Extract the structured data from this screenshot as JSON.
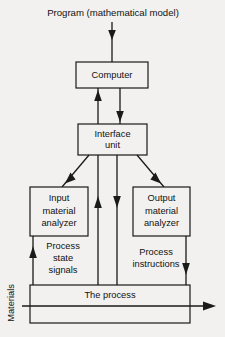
{
  "diagram": {
    "title": "Program (mathematical model)",
    "nodes": {
      "computer": {
        "label": "Computer"
      },
      "interface_unit": {
        "line1": "Interface",
        "line2": "unit"
      },
      "input_analyzer": {
        "line1": "Input",
        "line2": "material",
        "line3": "analyzer"
      },
      "output_analyzer": {
        "line1": "Output",
        "line2": "material",
        "line3": "analyzer"
      },
      "process": {
        "label": "The process"
      }
    },
    "edge_labels": {
      "process_state_signals": {
        "line1": "Process",
        "line2": "state",
        "line3": "signals"
      },
      "process_instructions": {
        "line1": "Process",
        "line2": "instructions"
      },
      "materials": {
        "label": "Materials"
      }
    },
    "colors": {
      "background": "#f2f1ef",
      "stroke": "#1a1a1a",
      "text": "#111111"
    }
  }
}
